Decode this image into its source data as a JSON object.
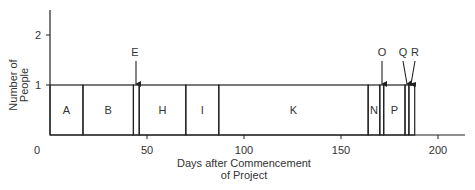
{
  "chart_data": {
    "type": "bar",
    "subtype": "resource-histogram",
    "title": "",
    "xlabel": "Days after Commencement of Project",
    "xlabel_lines": [
      "Days after Commencement",
      "of Project"
    ],
    "ylabel": "Number of People",
    "ylabel_lines": [
      "Number of",
      "People"
    ],
    "xlim": [
      0,
      215
    ],
    "ylim": [
      0,
      2.5
    ],
    "x_ticks": [
      0,
      50,
      100,
      150,
      200
    ],
    "x_tick_labels": [
      "0",
      "50",
      "100",
      "150",
      "200"
    ],
    "y_ticks": [
      1,
      2
    ],
    "y_tick_labels": [
      "1",
      "2"
    ],
    "grid": false,
    "legend": null,
    "activities": [
      {
        "name": "A",
        "start": 0,
        "end": 17,
        "people": 1,
        "label_inside": true
      },
      {
        "name": "B",
        "start": 17,
        "end": 43,
        "people": 1,
        "label_inside": true
      },
      {
        "name": "E",
        "start": 43,
        "end": 46,
        "people": 1,
        "label_inside": false,
        "arrow": true
      },
      {
        "name": "H",
        "start": 46,
        "end": 70,
        "people": 1,
        "label_inside": true
      },
      {
        "name": "I",
        "start": 70,
        "end": 87,
        "people": 1,
        "label_inside": true
      },
      {
        "name": "K",
        "start": 87,
        "end": 164,
        "people": 1,
        "label_inside": true
      },
      {
        "name": "N",
        "start": 164,
        "end": 170,
        "people": 1,
        "label_inside": true
      },
      {
        "name": "O",
        "start": 170,
        "end": 172,
        "people": 1,
        "label_inside": false,
        "arrow": true
      },
      {
        "name": "P",
        "start": 172,
        "end": 183,
        "people": 1,
        "label_inside": true
      },
      {
        "name": "Q",
        "start": 183,
        "end": 185,
        "people": 1,
        "label_inside": false,
        "arrow": true
      },
      {
        "name": "R",
        "start": 185,
        "end": 188,
        "people": 1,
        "label_inside": false,
        "arrow": true
      }
    ],
    "categories": [
      "A",
      "B",
      "E",
      "H",
      "I",
      "K",
      "N",
      "O",
      "P",
      "Q",
      "R"
    ],
    "values": [
      1,
      1,
      1,
      1,
      1,
      1,
      1,
      1,
      1,
      1,
      1
    ],
    "colors": {
      "line": "#222222",
      "text": "#333333",
      "background": "#ffffff"
    }
  }
}
